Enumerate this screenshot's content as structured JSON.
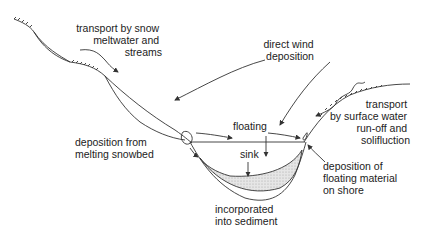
{
  "diagram": {
    "labels": {
      "snow_transport": [
        "transport by snow",
        "meltwater and",
        "streams"
      ],
      "wind": [
        "direct wind",
        "deposition"
      ],
      "surface_water": [
        "transport",
        "by surface water",
        "run-off and",
        "solifluction"
      ],
      "snowbed": [
        "deposition from",
        "melting snowbed"
      ],
      "floating": "floating",
      "sink": "sink",
      "shore": [
        "deposition of",
        "floating material",
        "on shore"
      ],
      "sediment": [
        "incorporated",
        "into sediment"
      ]
    }
  }
}
